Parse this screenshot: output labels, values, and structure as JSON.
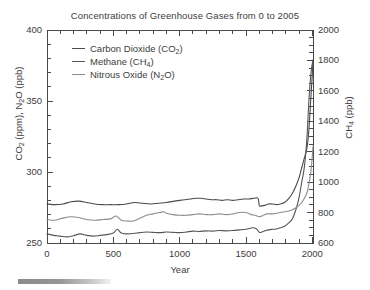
{
  "chart_data": {
    "type": "line",
    "title": "Concentrations of Greenhouse Gases from 0 to 2005",
    "xlabel": "Year",
    "ylabel_left": "CO2 (ppm), N2O (ppb)",
    "ylabel_right": "CH4 (ppb)",
    "xlim": [
      0,
      2005
    ],
    "ylim_left": [
      250,
      400
    ],
    "ylim_right": [
      600,
      2000
    ],
    "xticks": [
      0,
      500,
      1000,
      1500,
      2000
    ],
    "xtick_labels": [
      "0",
      "500",
      "1000",
      "1500",
      "2000"
    ],
    "yticks_left": [
      250,
      300,
      350,
      400
    ],
    "ytick_labels_left": [
      "250",
      "300",
      "350",
      "400"
    ],
    "yticks_right": [
      600,
      800,
      1000,
      1200,
      1400,
      1600,
      1800,
      2000
    ],
    "ytick_labels_right": [
      "600",
      "800",
      "1000",
      "1200",
      "1400",
      "1600",
      "1800",
      "2000"
    ],
    "x_minor_tick_step": 100,
    "y_left_minor_tick_step": 10,
    "y_right_minor_tick_step": 50,
    "grid": false,
    "legend_position": "upper-left",
    "series": [
      {
        "name": "Carbon Dioxide (CO2)",
        "label_main": "Carbon Dioxide (CO",
        "label_sub": "2",
        "label_tail": ")",
        "axis": "left",
        "color": "#4a4a4a",
        "x": [
          0,
          60,
          120,
          180,
          240,
          300,
          360,
          420,
          480,
          540,
          600,
          660,
          720,
          780,
          840,
          900,
          960,
          1000,
          1040,
          1080,
          1120,
          1160,
          1200,
          1240,
          1280,
          1320,
          1360,
          1400,
          1440,
          1480,
          1520,
          1560,
          1590,
          1600,
          1610,
          1640,
          1670,
          1700,
          1730,
          1760,
          1790,
          1820,
          1850,
          1880,
          1900,
          1920,
          1940,
          1960,
          1975,
          1990,
          2000,
          2005
        ],
        "y": [
          277.5,
          277.0,
          277.5,
          279.0,
          279.5,
          278.5,
          277.5,
          277.0,
          277.0,
          277.0,
          277.5,
          278.5,
          278.0,
          277.5,
          278.0,
          278.5,
          279.5,
          280.0,
          280.5,
          281.0,
          281.5,
          281.5,
          281.0,
          280.5,
          280.5,
          280.0,
          280.5,
          280.0,
          280.5,
          281.0,
          281.0,
          281.5,
          281.5,
          276.5,
          276.0,
          276.5,
          277.5,
          277.5,
          277.0,
          277.5,
          278.5,
          281.0,
          285.0,
          291.0,
          296.0,
          303.0,
          310.0,
          317.0,
          331.0,
          354.0,
          369.0,
          379.0
        ]
      },
      {
        "name": "Methane (CH4)",
        "label_main": "Methane (CH",
        "label_sub": "4",
        "label_tail": ")",
        "axis": "right",
        "color": "#555555",
        "x": [
          0,
          50,
          100,
          150,
          200,
          250,
          300,
          350,
          400,
          450,
          500,
          530,
          560,
          600,
          650,
          700,
          750,
          800,
          850,
          900,
          950,
          1000,
          1050,
          1100,
          1150,
          1200,
          1250,
          1300,
          1350,
          1400,
          1450,
          1500,
          1550,
          1580,
          1600,
          1620,
          1650,
          1680,
          1700,
          1730,
          1760,
          1790,
          1820,
          1850,
          1880,
          1900,
          1920,
          1940,
          1960,
          1975,
          1990,
          2000,
          2005
        ],
        "y": [
          660,
          650,
          645,
          640,
          648,
          660,
          650,
          645,
          650,
          655,
          665,
          690,
          665,
          660,
          662,
          668,
          672,
          670,
          668,
          672,
          670,
          668,
          672,
          678,
          676,
          680,
          678,
          682,
          680,
          682,
          686,
          690,
          700,
          692,
          670,
          672,
          682,
          688,
          690,
          692,
          700,
          710,
          730,
          760,
          830,
          900,
          1000,
          1100,
          1300,
          1550,
          1720,
          1780,
          1800
        ]
      },
      {
        "name": "Nitrous Oxide (N2O)",
        "label_main": "Nitrous Oxide (N",
        "label_sub": "2",
        "label_tail": "O)",
        "axis": "left",
        "color": "#8c8c8c",
        "x": [
          0,
          60,
          120,
          180,
          240,
          300,
          360,
          420,
          480,
          520,
          560,
          600,
          650,
          700,
          750,
          800,
          850,
          880,
          900,
          950,
          1000,
          1050,
          1100,
          1150,
          1200,
          1250,
          1300,
          1350,
          1400,
          1450,
          1500,
          1540,
          1570,
          1600,
          1630,
          1660,
          1700,
          1730,
          1760,
          1790,
          1820,
          1850,
          1880,
          1900,
          1920,
          1940,
          1960,
          1975,
          1990,
          2000,
          2005
        ],
        "y": [
          266.5,
          266.0,
          267.5,
          268.5,
          268.0,
          266.5,
          266.0,
          266.5,
          267.0,
          269.0,
          266.0,
          265.5,
          265.5,
          267.5,
          269.5,
          270.5,
          271.5,
          272.0,
          271.0,
          270.0,
          269.5,
          269.5,
          270.0,
          270.5,
          270.0,
          270.0,
          270.5,
          270.0,
          270.5,
          271.5,
          271.5,
          270.0,
          269.5,
          268.5,
          269.5,
          270.5,
          270.5,
          271.0,
          271.5,
          272.0,
          272.5,
          273.5,
          275.0,
          276.5,
          278.5,
          281.5,
          285.5,
          292.0,
          301.0,
          311.5,
          318.0
        ]
      }
    ]
  },
  "figure": {
    "title": "Concentrations of Greenhouse Gases from 0 to 2005",
    "x_axis_title": "Year",
    "bottom_bar_name": "scale-bar"
  }
}
